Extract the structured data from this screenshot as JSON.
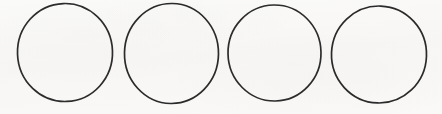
{
  "image": {
    "title": "Four hand-drawn circle outlines",
    "width": 442,
    "height": 114,
    "background_color": "#faf9f8",
    "paper_tint": "#f7f6f5",
    "stroke_color": "#2a2a2a",
    "shape_count": 4,
    "shape_type": "circle-outline",
    "fill": "none",
    "alt_text": "A row of four evenly spaced unfilled circles drawn with thin dark outlines on off-white paper"
  },
  "shapes": [
    {
      "name": "circle-1",
      "label": "Circle 1",
      "cx": 65.0,
      "cy": 52.5,
      "rx": 47.5,
      "ry": 49.0,
      "rotation": -2,
      "stroke_width": 1.7,
      "stroke_color": "#2c2c2c",
      "bbox": [
        17.5,
        3.5,
        112.5,
        101.5
      ]
    },
    {
      "name": "circle-2",
      "label": "Circle 2",
      "cx": 171.5,
      "cy": 53.5,
      "rx": 47.0,
      "ry": 50.0,
      "rotation": 1,
      "stroke_width": 1.7,
      "stroke_color": "#2a2a2a",
      "bbox": [
        124.5,
        3.5,
        218.5,
        103.5
      ]
    },
    {
      "name": "circle-3",
      "label": "Circle 3",
      "cx": 274.5,
      "cy": 53.0,
      "rx": 46.5,
      "ry": 48.0,
      "rotation": -1,
      "stroke_width": 1.7,
      "stroke_color": "#2c2c2c",
      "bbox": [
        228.0,
        5.0,
        321.0,
        101.0
      ]
    },
    {
      "name": "circle-4",
      "label": "Circle 4",
      "cx": 379.0,
      "cy": 54.5,
      "rx": 47.5,
      "ry": 48.5,
      "rotation": 2,
      "stroke_width": 1.7,
      "stroke_color": "#2a2a2a",
      "bbox": [
        331.5,
        6.0,
        426.5,
        103.0
      ]
    }
  ]
}
